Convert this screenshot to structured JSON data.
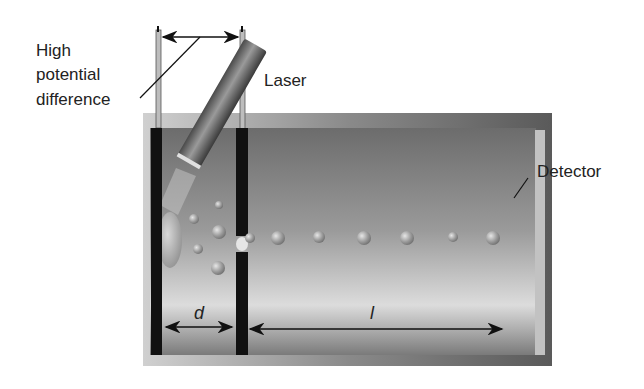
{
  "diagram": {
    "type": "time-of-flight mass spectrometer schematic",
    "labels": {
      "potential_line1": "High",
      "potential_line2": "potential",
      "potential_line3": "difference",
      "laser": "Laser",
      "detector": "Detector",
      "d": "d",
      "l": "l"
    },
    "colors": {
      "chamber_dark": "#6a6a6a",
      "chamber_light": "#d8d8d8",
      "electrode": "#111111",
      "detector": "#bdbdbd",
      "ion": "#9a9a9a"
    }
  }
}
